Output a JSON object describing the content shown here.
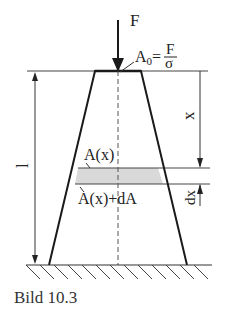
{
  "figure": {
    "force_label": "F",
    "area_top_label": "A",
    "area_top_sub": "0",
    "area_top_eq": "=",
    "area_top_num": "F",
    "area_top_den": "σ",
    "length_label": "l",
    "x_label": "x",
    "dx_label": "dx",
    "area_x_label": "A(x)",
    "area_x_dA_label": "A(x)+dA"
  },
  "caption": "Bild 10.3",
  "colors": {
    "line": "#1a1a1a",
    "shade": "#d9d9d9",
    "thin": "#444444"
  }
}
